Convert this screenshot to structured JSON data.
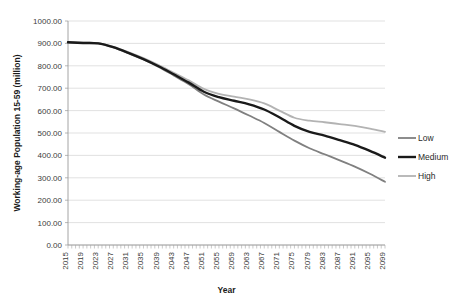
{
  "chart_data": {
    "type": "line",
    "title": "",
    "xlabel": "Year",
    "ylabel": "Working-age Population 15-59 (million)",
    "xlim": [
      2015,
      2099
    ],
    "ylim": [
      0,
      1000
    ],
    "ytick_labels": [
      "1000.00",
      "900.00",
      "800.00",
      "700.00",
      "600.00",
      "500.00",
      "400.00",
      "300.00",
      "200.00",
      "100.00",
      "0.00"
    ],
    "ytick_values": [
      1000,
      900,
      800,
      700,
      600,
      500,
      400,
      300,
      200,
      100,
      0
    ],
    "xtick_labels": [
      "2015",
      "2019",
      "2023",
      "2027",
      "2031",
      "2035",
      "2039",
      "2043",
      "2047",
      "2051",
      "2055",
      "2059",
      "2063",
      "2067",
      "2071",
      "2075",
      "2079",
      "2083",
      "2087",
      "2091",
      "2095",
      "2099"
    ],
    "xtick_values": [
      2015,
      2019,
      2023,
      2027,
      2031,
      2035,
      2039,
      2043,
      2047,
      2051,
      2055,
      2059,
      2063,
      2067,
      2071,
      2075,
      2079,
      2083,
      2087,
      2091,
      2095,
      2099
    ],
    "grid": "horizontal",
    "legend_position": "right",
    "x": [
      2015,
      2019,
      2023,
      2027,
      2031,
      2035,
      2039,
      2043,
      2047,
      2051,
      2055,
      2059,
      2063,
      2067,
      2071,
      2075,
      2079,
      2083,
      2087,
      2091,
      2095,
      2099
    ],
    "series": [
      {
        "name": "Low",
        "color": "#808080",
        "width": 1.8,
        "values": [
          905,
          902,
          900,
          882,
          856,
          828,
          795,
          757,
          718,
          672,
          640,
          610,
          578,
          545,
          505,
          466,
          432,
          405,
          378,
          350,
          318,
          282
        ]
      },
      {
        "name": "Medium",
        "color": "#1a1a1a",
        "width": 2.4,
        "values": [
          905,
          902,
          900,
          883,
          858,
          830,
          798,
          762,
          725,
          684,
          660,
          644,
          628,
          605,
          570,
          532,
          505,
          488,
          468,
          447,
          420,
          390
        ]
      },
      {
        "name": "High",
        "color": "#b3b3b3",
        "width": 1.8,
        "values": [
          905,
          903,
          901,
          885,
          861,
          834,
          803,
          769,
          735,
          697,
          675,
          662,
          650,
          632,
          600,
          568,
          555,
          548,
          540,
          532,
          520,
          505
        ]
      }
    ]
  },
  "legend": {
    "items": [
      {
        "label": "Low"
      },
      {
        "label": "Medium"
      },
      {
        "label": "High"
      }
    ]
  }
}
